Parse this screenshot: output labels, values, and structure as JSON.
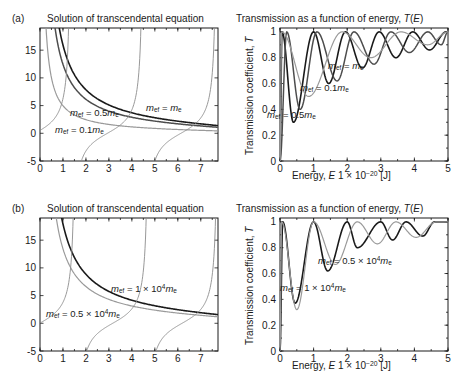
{
  "figure": {
    "panels": [
      {
        "tag": "(a)",
        "left": {
          "title": "Solution of transcendental equation",
          "xticks": [
            "0",
            "1",
            "2",
            "3",
            "4",
            "5",
            "6",
            "7"
          ],
          "yticks": [
            "-5",
            "0",
            "5",
            "10",
            "15"
          ],
          "annotations": [
            {
              "name": "curve-label-half-me",
              "text": "m_ef = 0.5m_e"
            },
            {
              "name": "curve-label-me",
              "text": "m_ef = m_e"
            },
            {
              "name": "curve-label-tenth-me",
              "text": "m_ef = 0.1m_e"
            }
          ]
        },
        "right": {
          "title": "Transmission as a function of energy, T(E)",
          "xlabel": "Energy, E 1 × 10^-20 [J]",
          "ylabel": "Transmission coefficient, T",
          "xticks": [
            "0",
            "1",
            "2",
            "3",
            "4",
            "5"
          ],
          "yticks": [
            "0",
            "0.2",
            "0.4",
            "0.6",
            "0.8",
            "1"
          ],
          "annotations": [
            {
              "name": "curve-label-me",
              "text": "m_ef = m_e"
            },
            {
              "name": "curve-label-tenth-me",
              "text": "m_ef = 0.1m_e"
            },
            {
              "name": "curve-label-half-me",
              "text": "m_ef = 0.5m_e"
            }
          ]
        }
      },
      {
        "tag": "(b)",
        "left": {
          "title": "Solution of transcendental equation",
          "xticks": [
            "0",
            "1",
            "2",
            "3",
            "4",
            "5",
            "6",
            "7"
          ],
          "yticks": [
            "-5",
            "0",
            "5",
            "10",
            "15"
          ],
          "annotations": [
            {
              "name": "curve-label-1e4-me",
              "text": "m_ef = 1 × 10^4 m_e"
            },
            {
              "name": "curve-label-05e4-me",
              "text": "m_ef = 0.5 × 10^4 m_e"
            }
          ]
        },
        "right": {
          "title": "Transmission as a function of energy, T(E)",
          "xlabel": "Energy, E 1 × 10^-20 [J]",
          "ylabel": "Transmission coefficient, T",
          "xticks": [
            "0",
            "1",
            "2",
            "3",
            "4",
            "5"
          ],
          "yticks": [
            "0",
            "0.2",
            "0.4",
            "0.6",
            "0.8",
            "1"
          ],
          "annotations": [
            {
              "name": "curve-label-05e4-me",
              "text": "m_ef = 0.5 × 10^4 m_e"
            },
            {
              "name": "curve-label-1e4-me",
              "text": "m_ef = 1 × 10^4 m_e"
            }
          ]
        }
      }
    ]
  },
  "colors": {
    "dark": "#1a1a1a",
    "mid": "#4d4d4d",
    "light": "#9a9a9a",
    "thin": "#8c8c8c",
    "background": "#ffffff"
  },
  "chart_data": [
    {
      "id": "a-left",
      "type": "line",
      "title": "Solution of transcendental equation",
      "panel": "(a)",
      "xlabel": "",
      "ylabel": "",
      "xlim": [
        0,
        7.75
      ],
      "ylim": [
        -5,
        19
      ],
      "xticks": [
        0,
        1,
        2,
        3,
        4,
        5,
        6,
        7
      ],
      "yticks": [
        -5,
        0,
        5,
        10,
        15
      ],
      "grid": false,
      "legend": "inline-annotations",
      "series": [
        {
          "name": "m_ef = m_e",
          "style": "dark",
          "kind": "decaying-branch",
          "scale": 16.0,
          "note": "hyperbolic-like decreasing branch, outermost of the two dark curves"
        },
        {
          "name": "m_ef = 0.5m_e",
          "style": "mid",
          "kind": "decaying-branch",
          "scale": 12.5,
          "note": "second decreasing branch, left of the m_e curve"
        },
        {
          "name": "m_ef = 0.1m_e",
          "style": "light",
          "kind": "decaying-branch",
          "scale": 5.0,
          "note": "lowest decreasing branch, flattens near y=0"
        },
        {
          "name": "tan branch 1",
          "style": "thin",
          "kind": "tangent",
          "asymptote": 1.35
        },
        {
          "name": "tan branch 2",
          "style": "thin",
          "kind": "tangent",
          "asymptote": 4.55
        },
        {
          "name": "tan branch 3",
          "style": "thin",
          "kind": "tangent",
          "asymptote": 7.72
        },
        {
          "name": "tan branch 0",
          "style": "thin",
          "kind": "tangent",
          "asymptote": -1.8
        }
      ],
      "intersections_note": "roots occur where decaying branches cross tangent branches"
    },
    {
      "id": "a-right",
      "type": "line",
      "title": "Transmission as a function of energy, T(E)",
      "panel": "(a)",
      "xlabel": "Energy, E 1 × 10^-20 [J]",
      "ylabel": "Transmission coefficient, T",
      "xlim": [
        0,
        5
      ],
      "ylim": [
        0,
        1.03
      ],
      "xticks": [
        0,
        1,
        2,
        3,
        4,
        5
      ],
      "yticks": [
        0,
        0.2,
        0.4,
        0.6,
        0.8,
        1
      ],
      "grid": false,
      "series": [
        {
          "name": "m_ef = 0.5m_e",
          "style": "dark",
          "resonances": [
            0.06,
            1.0,
            1.95,
            2.95,
            3.95,
            4.95
          ],
          "minima": [
            {
              "x": 0.4,
              "y": 0.3
            },
            {
              "x": 1.45,
              "y": 0.6
            },
            {
              "x": 2.45,
              "y": 0.72
            },
            {
              "x": 3.45,
              "y": 0.8
            },
            {
              "x": 4.45,
              "y": 0.86
            }
          ]
        },
        {
          "name": "m_ef = m_e",
          "style": "mid",
          "resonances": [
            0.2,
            1.1,
            2.2,
            3.3,
            4.4
          ],
          "minima": [
            {
              "x": 0.6,
              "y": 0.4
            },
            {
              "x": 1.7,
              "y": 0.62
            },
            {
              "x": 2.8,
              "y": 0.75
            },
            {
              "x": 3.85,
              "y": 0.84
            },
            {
              "x": 4.8,
              "y": 0.9
            }
          ]
        },
        {
          "name": "m_ef = 0.1m_e",
          "style": "light",
          "resonances": [
            0.05,
            1.85,
            3.6
          ],
          "minima": [
            {
              "x": 0.85,
              "y": 0.5
            },
            {
              "x": 2.7,
              "y": 0.8
            },
            {
              "x": 4.4,
              "y": 0.9
            }
          ]
        }
      ]
    },
    {
      "id": "b-left",
      "type": "line",
      "title": "Solution of transcendental equation",
      "panel": "(b)",
      "xlabel": "",
      "ylabel": "",
      "xlim": [
        0,
        7.75
      ],
      "ylim": [
        -5,
        19
      ],
      "xticks": [
        0,
        1,
        2,
        3,
        4,
        5,
        6,
        7
      ],
      "yticks": [
        -5,
        0,
        5,
        10,
        15
      ],
      "grid": false,
      "series": [
        {
          "name": "m_ef = 1 × 10^4 m_e",
          "style": "dark",
          "kind": "decaying-branch",
          "scale": 18.0
        },
        {
          "name": "m_ef = 0.5 × 10^4 m_e",
          "style": "light",
          "kind": "decaying-branch",
          "scale": 13.5
        },
        {
          "name": "tan branch 1",
          "style": "thin",
          "kind": "tangent",
          "asymptote": 1.58
        },
        {
          "name": "tan branch 2",
          "style": "thin",
          "kind": "tangent",
          "asymptote": 4.6
        },
        {
          "name": "tan branch 3",
          "style": "thin",
          "kind": "tangent",
          "asymptote": 7.7
        },
        {
          "name": "tan branch 0",
          "style": "thin",
          "kind": "tangent",
          "asymptote": -1.6
        }
      ]
    },
    {
      "id": "b-right",
      "type": "line",
      "title": "Transmission as a function of energy, T(E)",
      "panel": "(b)",
      "xlabel": "Energy, E 1 × 10^-20 [J]",
      "ylabel": "Transmission coefficient, T",
      "xlim": [
        0,
        5
      ],
      "ylim": [
        0,
        1.03
      ],
      "xticks": [
        0,
        1,
        2,
        3,
        4,
        5
      ],
      "yticks": [
        0,
        0.2,
        0.4,
        0.6,
        0.8,
        1
      ],
      "grid": false,
      "series": [
        {
          "name": "m_ef = 1 × 10^4 m_e",
          "style": "dark",
          "resonances": [
            0.08,
            1.0,
            2.0,
            3.0,
            3.75,
            4.6
          ],
          "minima": [
            {
              "x": 0.45,
              "y": 0.37
            },
            {
              "x": 1.42,
              "y": 0.62
            },
            {
              "x": 2.3,
              "y": 0.8
            },
            {
              "x": 3.35,
              "y": 0.86
            },
            {
              "x": 4.25,
              "y": 0.89
            }
          ]
        },
        {
          "name": "m_ef = 0.5 × 10^4 m_e",
          "style": "light",
          "resonances": [
            0.05,
            1.0,
            2.3,
            3.45,
            4.65
          ],
          "minima": [
            {
              "x": 0.5,
              "y": 0.32
            },
            {
              "x": 1.65,
              "y": 0.67
            },
            {
              "x": 2.9,
              "y": 0.83
            },
            {
              "x": 4.05,
              "y": 0.88
            }
          ]
        }
      ]
    }
  ]
}
